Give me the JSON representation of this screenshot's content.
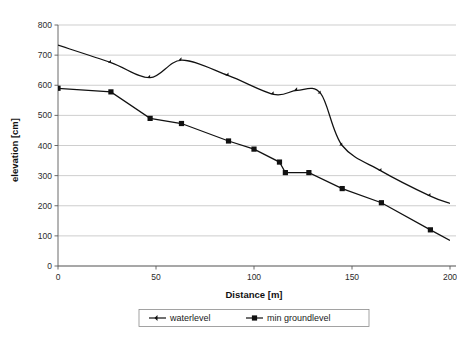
{
  "chart_data": {
    "type": "line",
    "title": "",
    "xlabel": "Distance [m]",
    "ylabel": "elevation [cm]",
    "xlim": [
      0,
      200
    ],
    "ylim": [
      0,
      800
    ],
    "xticks": [
      0,
      50,
      100,
      150,
      200
    ],
    "xtick_labels": [
      "0",
      "50",
      "100",
      "150",
      "200"
    ],
    "yticks": [
      0,
      100,
      200,
      300,
      400,
      500,
      600,
      700,
      800
    ],
    "ytick_labels": [
      "0",
      "100",
      "200",
      "300",
      "400",
      "500",
      "600",
      "700",
      "800"
    ],
    "grid": "horizontal",
    "legend_position": "bottom-center",
    "series": [
      {
        "name": "waterlevel",
        "marker": "diamond",
        "color": "#111111",
        "smoothed": true,
        "points": [
          {
            "x": 0,
            "y": 733
          },
          {
            "x": 27,
            "y": 675
          },
          {
            "x": 47,
            "y": 625
          },
          {
            "x": 63,
            "y": 683
          },
          {
            "x": 87,
            "y": 632
          },
          {
            "x": 110,
            "y": 570
          },
          {
            "x": 122,
            "y": 583
          },
          {
            "x": 134,
            "y": 573
          },
          {
            "x": 145,
            "y": 400
          },
          {
            "x": 165,
            "y": 315
          },
          {
            "x": 190,
            "y": 232
          },
          {
            "x": 200,
            "y": 208
          }
        ]
      },
      {
        "name": "min groundlevel",
        "marker": "square",
        "color": "#111111",
        "smoothed": false,
        "points": [
          {
            "x": 0,
            "y": 590
          },
          {
            "x": 27,
            "y": 578
          },
          {
            "x": 47,
            "y": 490
          },
          {
            "x": 63,
            "y": 473
          },
          {
            "x": 87,
            "y": 415
          },
          {
            "x": 100,
            "y": 388
          },
          {
            "x": 113,
            "y": 345
          },
          {
            "x": 116,
            "y": 310
          },
          {
            "x": 128,
            "y": 310
          },
          {
            "x": 145,
            "y": 257
          },
          {
            "x": 165,
            "y": 210
          },
          {
            "x": 190,
            "y": 120
          },
          {
            "x": 200,
            "y": 85
          }
        ]
      }
    ],
    "legend": [
      {
        "label": "waterlevel",
        "marker": "diamond"
      },
      {
        "label": "min groundlevel",
        "marker": "square"
      }
    ]
  }
}
